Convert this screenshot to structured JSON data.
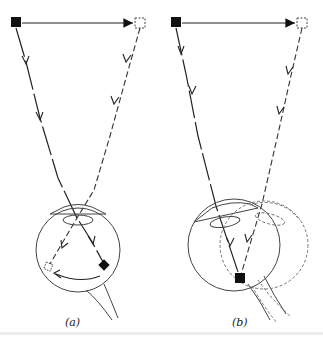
{
  "figure": {
    "panels": [
      {
        "id": "a",
        "caption": "(a)",
        "description": "Eye fixating; object moves from left (filled square) to right (dashed square); image on retina moves in opposite direction"
      },
      {
        "id": "b",
        "caption": "(b)",
        "description": "Eye rotates to track object; image stays at the fovea"
      }
    ],
    "colors": {
      "ink": "#1a1a1a",
      "dashed": "#555555",
      "background": "#ffffff"
    }
  }
}
